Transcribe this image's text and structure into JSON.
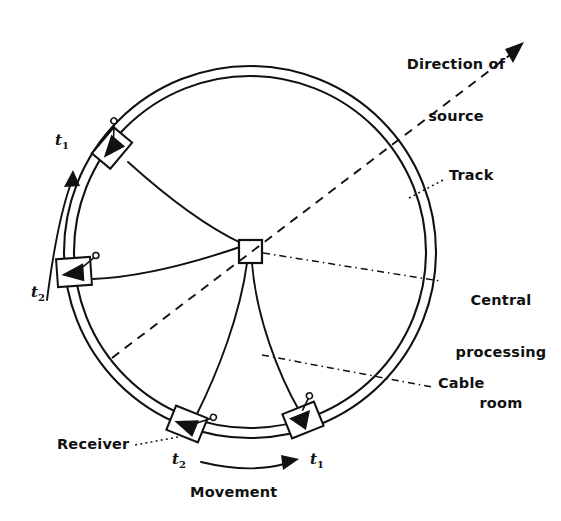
{
  "figure": {
    "ink_color": "#111111",
    "background_color": "#ffffff"
  },
  "labels": {
    "direction_of_source_line1": "Direction of",
    "direction_of_source_line2": "source",
    "track": "Track",
    "central_processing_line1": "Central",
    "central_processing_line2": "processing",
    "central_processing_line3": "room",
    "cable": "Cable",
    "receiver": "Receiver",
    "movement": "Movement"
  },
  "time_markers": {
    "left_upper": "t",
    "left_upper_sub": "1",
    "left_lower": "t",
    "left_lower_sub": "2",
    "bottom_left": "t",
    "bottom_left_sub": "2",
    "bottom_right": "t",
    "bottom_right_sub": "1"
  },
  "geometry": {
    "center": {
      "x": 250,
      "y": 252
    },
    "track_outer_radius": 186,
    "track_inner_radius": 176,
    "cpu_room": {
      "x": 239,
      "y": 240,
      "width": 23,
      "height": 23
    }
  },
  "receivers": [
    {
      "name": "receiver-top-left",
      "x": 112,
      "y": 148,
      "angle_deg": -50,
      "time": "t1"
    },
    {
      "name": "receiver-left",
      "x": 74,
      "y": 272,
      "angle_deg": -4,
      "time": "t2"
    },
    {
      "name": "receiver-bottom-left",
      "x": 187,
      "y": 424,
      "angle_deg": 22,
      "time": "t2"
    },
    {
      "name": "receiver-bottom-right",
      "x": 303,
      "y": 420,
      "angle_deg": -22,
      "time": "t1"
    }
  ],
  "annotations": {
    "source_arrow_tip": {
      "x": 522,
      "y": 45
    },
    "source_line_start": {
      "x": 112,
      "y": 358
    },
    "movement_direction": "clockwise-at-bottom-left-to-right"
  }
}
